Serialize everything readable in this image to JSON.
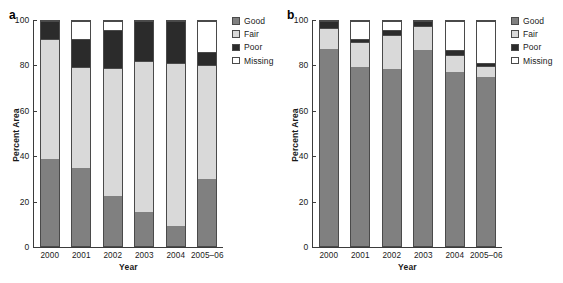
{
  "figure": {
    "panels": [
      {
        "panel_label": "a",
        "legend_title": "",
        "chart_index": 0
      },
      {
        "panel_label": "b",
        "legend_title": "",
        "chart_index": 1
      }
    ]
  },
  "legend": {
    "entries": [
      {
        "label": "Good",
        "color": "#808080",
        "icon": "legend-swatch-good"
      },
      {
        "label": "Fair",
        "color": "#d9d9d9",
        "icon": "legend-swatch-fair"
      },
      {
        "label": "Poor",
        "color": "#2b2b2b",
        "icon": "legend-swatch-poor"
      },
      {
        "label": "Missing",
        "color": "#ffffff",
        "icon": "legend-swatch-missing"
      }
    ]
  },
  "chart_data": [
    {
      "type": "bar",
      "stacked": true,
      "panel": "a",
      "title": "",
      "xlabel": "Year",
      "ylabel": "Percent Area",
      "categories": [
        "2000",
        "2001",
        "2002",
        "2003",
        "2004",
        "2005-06"
      ],
      "ylim": [
        0,
        100
      ],
      "yticks": [
        0,
        20,
        40,
        60,
        80,
        100
      ],
      "ytick_labels": [
        "0",
        "20",
        "40",
        "60",
        "80",
        "100"
      ],
      "grid": false,
      "legend_position": "right",
      "series": [
        {
          "name": "Good",
          "color": "#808080",
          "values": [
            39.0,
            35.0,
            22.5,
            15.2,
            9.2,
            30.0
          ]
        },
        {
          "name": "Fair",
          "color": "#d9d9d9",
          "values": [
            53.5,
            45.0,
            57.2,
            67.5,
            72.5,
            51.0
          ]
        },
        {
          "name": "Poor",
          "color": "#2b2b2b",
          "values": [
            7.5,
            12.5,
            16.8,
            17.3,
            18.3,
            5.5
          ]
        },
        {
          "name": "Missing",
          "color": "#ffffff",
          "values": [
            0.0,
            7.5,
            3.5,
            0.0,
            0.0,
            13.5
          ]
        }
      ],
      "cumulative_tops": {
        "Good": [
          39.0,
          35.0,
          22.5,
          15.2,
          9.2,
          30.0
        ],
        "Fair": [
          92.5,
          80.0,
          79.7,
          82.7,
          81.7,
          81.0
        ],
        "Poor": [
          100.0,
          92.5,
          96.5,
          100.0,
          100.0,
          86.5
        ],
        "Missing": [
          100.0,
          100.0,
          100.0,
          100.0,
          100.0,
          100.0
        ]
      }
    },
    {
      "type": "bar",
      "stacked": true,
      "panel": "b",
      "title": "",
      "xlabel": "Year",
      "ylabel": "Percent Area",
      "categories": [
        "2000",
        "2001",
        "2002",
        "2003",
        "2004",
        "2005-06"
      ],
      "ylim": [
        0,
        100
      ],
      "yticks": [
        0,
        20,
        40,
        60,
        80,
        100
      ],
      "ytick_labels": [
        "0",
        "20",
        "40",
        "60",
        "80",
        "100"
      ],
      "grid": false,
      "legend_position": "right",
      "series": [
        {
          "name": "Good",
          "color": "#808080",
          "values": [
            88.3,
            80.6,
            79.8,
            87.8,
            78.4,
            76.0
          ]
        },
        {
          "name": "Fair",
          "color": "#d9d9d9",
          "values": [
            9.2,
            11.0,
            14.8,
            10.2,
            7.3,
            4.5
          ]
        },
        {
          "name": "Poor",
          "color": "#2b2b2b",
          "values": [
            2.5,
            0.9,
            1.6,
            2.0,
            1.8,
            0.9
          ]
        },
        {
          "name": "Missing",
          "color": "#ffffff",
          "values": [
            0.0,
            7.5,
            3.8,
            0.0,
            12.5,
            18.6
          ]
        }
      ],
      "cumulative_tops": {
        "Good": [
          88.3,
          80.6,
          79.8,
          87.8,
          78.4,
          76.0
        ],
        "Fair": [
          97.5,
          91.6,
          94.6,
          98.0,
          85.7,
          80.5
        ],
        "Poor": [
          100.0,
          92.5,
          96.2,
          100.0,
          87.5,
          81.4
        ],
        "Missing": [
          100.0,
          100.0,
          100.0,
          100.0,
          100.0,
          100.0
        ]
      }
    }
  ]
}
